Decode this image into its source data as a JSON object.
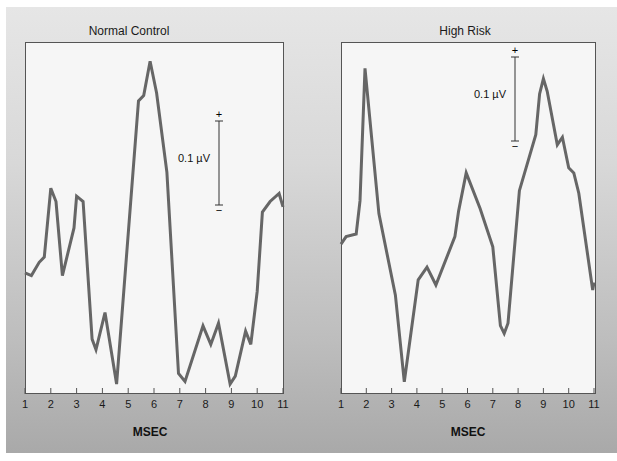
{
  "chart_data": [
    {
      "type": "line",
      "title": "Normal Control",
      "xlabel": "MSEC",
      "ylabel": "",
      "x_ticks": [
        "1",
        "2",
        "3",
        "4",
        "5",
        "6",
        "7",
        "8",
        "9",
        "10",
        "11"
      ],
      "xlim": [
        1,
        11
      ],
      "scale_bar": {
        "label": "0.1 µV",
        "plus": "+",
        "minus": "−"
      },
      "series": [
        {
          "name": "Normal Control",
          "x": [
            1,
            1.25,
            1.55,
            1.75,
            2.0,
            2.2,
            2.45,
            2.9,
            3.0,
            3.25,
            3.6,
            3.75,
            4.1,
            4.55,
            5.4,
            5.6,
            5.85,
            6.1,
            6.5,
            6.95,
            7.2,
            7.9,
            8.2,
            8.5,
            8.95,
            9.15,
            9.55,
            9.75,
            10.0,
            10.2,
            10.5,
            10.85,
            11.0
          ],
          "y": [
            0.05,
            0.04,
            0.09,
            0.11,
            0.37,
            0.32,
            0.04,
            0.22,
            0.34,
            0.32,
            -0.2,
            -0.24,
            -0.1,
            -0.37,
            0.7,
            0.72,
            0.85,
            0.73,
            0.43,
            -0.33,
            -0.36,
            -0.15,
            -0.22,
            -0.14,
            -0.37,
            -0.34,
            -0.17,
            -0.22,
            -0.02,
            0.28,
            0.32,
            0.35,
            0.3
          ]
        }
      ],
      "ylim": [
        -0.4,
        0.9
      ]
    },
    {
      "type": "line",
      "title": "High Risk",
      "xlabel": "MSEC",
      "ylabel": "",
      "x_ticks": [
        "1",
        "2",
        "3",
        "4",
        "5",
        "6",
        "7",
        "8",
        "9",
        "10",
        "11"
      ],
      "xlim": [
        1,
        11
      ],
      "scale_bar": {
        "label": "0.1 µV",
        "plus": "+",
        "minus": "−"
      },
      "series": [
        {
          "name": "High Risk",
          "x": [
            1,
            1.2,
            1.6,
            1.75,
            1.95,
            2.5,
            3.15,
            3.5,
            4.05,
            4.4,
            4.75,
            5.5,
            5.65,
            5.95,
            6.5,
            7.0,
            7.3,
            7.45,
            7.6,
            8.05,
            8.7,
            8.85,
            9.0,
            9.15,
            9.55,
            9.75,
            10.0,
            10.2,
            10.4,
            10.95,
            11.0
          ],
          "y": [
            0.13,
            0.16,
            0.17,
            0.3,
            0.82,
            0.25,
            -0.07,
            -0.41,
            -0.01,
            0.04,
            -0.03,
            0.16,
            0.26,
            0.41,
            0.27,
            0.12,
            -0.19,
            -0.22,
            -0.18,
            0.34,
            0.56,
            0.72,
            0.78,
            0.73,
            0.52,
            0.55,
            0.43,
            0.41,
            0.33,
            -0.05,
            -0.02
          ]
        }
      ],
      "ylim": [
        -0.45,
        0.9
      ]
    }
  ],
  "panels": {
    "left": {
      "title": "Normal Control",
      "xlabel": "MSEC",
      "scale_label": "0.1 µV",
      "plus": "+",
      "minus": "−"
    },
    "right": {
      "title": "High Risk",
      "xlabel": "MSEC",
      "scale_label": "0.1 µV",
      "plus": "+",
      "minus": "−"
    }
  },
  "ticks": [
    "1",
    "2",
    "3",
    "4",
    "5",
    "6",
    "7",
    "8",
    "9",
    "10",
    "11"
  ],
  "colors": {
    "line": "#666666",
    "frame": "#555555",
    "plot_bg": "#f6f6f6"
  }
}
